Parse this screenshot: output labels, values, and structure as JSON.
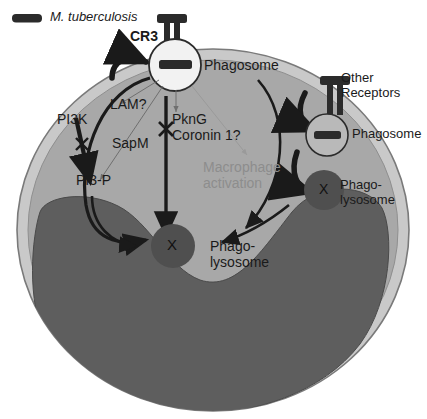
{
  "figure": {
    "type": "cell-biology-diagram"
  },
  "legend": {
    "icon": "bacterium-rod-icon",
    "label": "M. tuberculosis"
  },
  "receptors": {
    "cr3": "CR3",
    "other_line1": "Other",
    "other_line2": "Receptors"
  },
  "organelles": {
    "phagosome_top": "Phagosome",
    "phagosome_right": "Phagosome",
    "phagolysosome_center_line1": "Phago-",
    "phagolysosome_center_line2": "lysosome",
    "phagolysosome_right_line1": "Phago-",
    "phagolysosome_right_line2": "lysosome",
    "x_mark": "X"
  },
  "factors": {
    "pi3k": "PI3K",
    "pi3p": "PI3-P",
    "lam": "LAM?",
    "sapm": "SapM",
    "pkng": "PknG",
    "coronin": "Coronin 1?",
    "macrophage_activation_line1": "Macrophage",
    "macrophage_activation_line2": "activation",
    "block_mark": "X"
  },
  "colors": {
    "cytoplasm": "#a8a8a8",
    "cytoplasm_rim": "#c9c9c9",
    "nucleus": "#5e5e5e",
    "phagosome_fill": "#f2f2f2",
    "phagosome_right_fill": "#b9b9b9",
    "phagolysosome_fill": "#4f4f4f",
    "bacterium": "#2b2b2b",
    "arrow": "#1a1a1a",
    "dim_text": "#8d8d8d"
  }
}
